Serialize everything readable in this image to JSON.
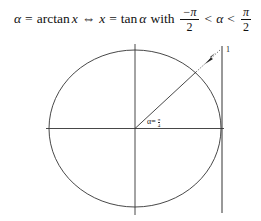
{
  "formula": {
    "alpha": "α",
    "eq1": "=",
    "arctan": "arctan",
    "x1": "x",
    "equiv": "⇔",
    "x2": "x",
    "eq2": "=",
    "tan": "tan",
    "alpha2": "α",
    "with": "with",
    "frac1_num": "−π",
    "frac1_den": "2",
    "lt1": "<",
    "alpha3": "α",
    "lt2": "<",
    "frac2_num": "π",
    "frac2_den": "2"
  },
  "diagram": {
    "angle_label": "α=",
    "angle_frac_num": "π",
    "angle_frac_den": "4",
    "tangent_label": "1",
    "stroke_color": "#333333"
  }
}
